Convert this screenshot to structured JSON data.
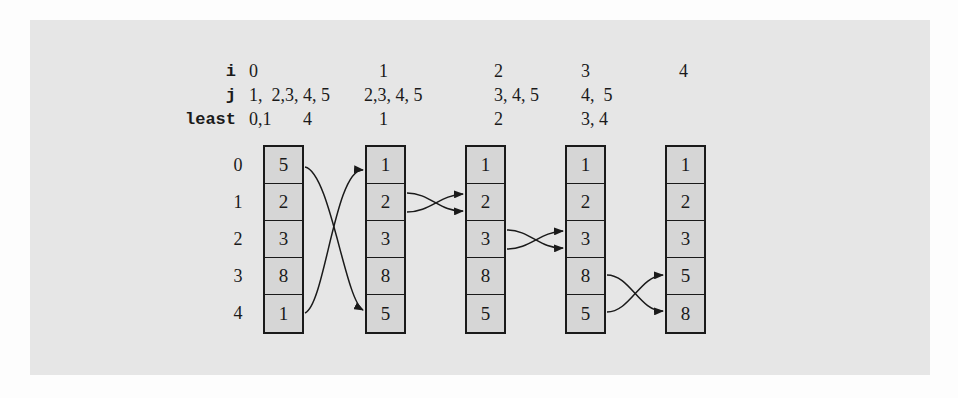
{
  "figure": {
    "row_labels": {
      "i": "i",
      "j": "j",
      "least": "least"
    },
    "passes": [
      {
        "i": "0",
        "j": "1,  2,3, 4, 5",
        "least": "0,1       4"
      },
      {
        "i": "1",
        "j": "2,3, 4, 5",
        "least": "1"
      },
      {
        "i": "2",
        "j": "3, 4, 5",
        "least": "2"
      },
      {
        "i": "3",
        "j": "4,  5",
        "least": "3, 4"
      },
      {
        "i": "4",
        "j": "",
        "least": ""
      }
    ],
    "indices": [
      "0",
      "1",
      "2",
      "3",
      "4"
    ],
    "arrays": [
      [
        "5",
        "2",
        "3",
        "8",
        "1"
      ],
      [
        "1",
        "2",
        "3",
        "8",
        "5"
      ],
      [
        "1",
        "2",
        "3",
        "8",
        "5"
      ],
      [
        "1",
        "2",
        "3",
        "8",
        "5"
      ],
      [
        "1",
        "2",
        "3",
        "5",
        "8"
      ]
    ],
    "swaps": [
      {
        "from_array": 0,
        "to_array": 1,
        "positions": [
          0,
          4
        ]
      },
      {
        "from_array": 1,
        "to_array": 2,
        "positions": [
          1,
          1
        ]
      },
      {
        "from_array": 2,
        "to_array": 3,
        "positions": [
          2,
          2
        ]
      },
      {
        "from_array": 3,
        "to_array": 4,
        "positions": [
          3,
          4
        ]
      }
    ],
    "colors": {
      "panel": "#e6e6e6",
      "cell_fill": "#d6d6d6",
      "stroke": "#1a1a1a"
    }
  }
}
